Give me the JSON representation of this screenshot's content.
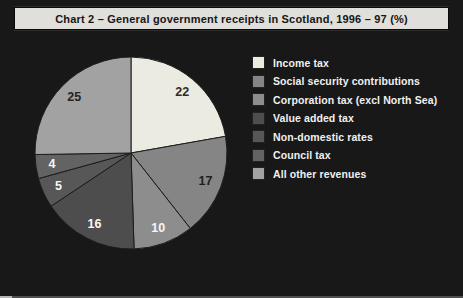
{
  "chart_data": {
    "type": "pie",
    "title": "Chart 2 – General government receipts in Scotland, 1996 – 97 (%)",
    "unit": "%",
    "legend_position": "right",
    "start_angle_deg": 0,
    "clockwise": true,
    "slices": [
      {
        "label": "Income tax",
        "value": 22,
        "color": "#ecebe1",
        "label_color": "#2d2d2d"
      },
      {
        "label": "Social security contributions",
        "value": 17,
        "color": "#858585",
        "label_color": "#1e1e1e"
      },
      {
        "label": "Corporation tax (excl North Sea)",
        "value": 10,
        "color": "#8d8d8d",
        "label_color": "#f6f6f6"
      },
      {
        "label": "Value added tax",
        "value": 16,
        "color": "#4d4d4d",
        "label_color": "#f6f6f6"
      },
      {
        "label": "Non-domestic rates",
        "value": 5,
        "color": "#575757",
        "label_color": "#f6f6f6"
      },
      {
        "label": "Council tax",
        "value": 4,
        "color": "#636363",
        "label_color": "#f6f6f6"
      },
      {
        "label": "All other revenues",
        "value": 25,
        "color": "#a2a2a2",
        "label_color": "#242424"
      }
    ],
    "colors": {
      "background": "#181818",
      "title_bar_bg": "#e0dfdb",
      "title_text": "#161616",
      "legend_text": "#f0f0f0",
      "slice_divider": "#1d1d1d"
    }
  }
}
